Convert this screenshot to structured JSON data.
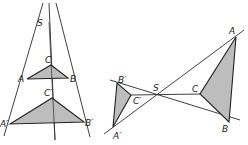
{
  "figures": {
    "left": {
      "title": "Central similarity with center S outside (same side)",
      "labels": {
        "S": "S",
        "A": "A",
        "B": "B",
        "C": "C",
        "A_prime": "A′",
        "B_prime": "B′",
        "C_prime": "C′"
      }
    },
    "right": {
      "title": "Central similarity with center S between figures",
      "labels": {
        "S": "S",
        "A": "A",
        "B": "B",
        "C": "C",
        "A_prime": "A′",
        "B_prime": "B′",
        "C_prime": "C′"
      }
    }
  },
  "colors": {
    "fill": "#bdbdbd",
    "stroke": "#222222",
    "background": "#ffffff"
  }
}
